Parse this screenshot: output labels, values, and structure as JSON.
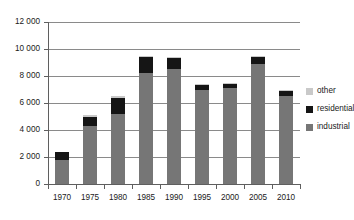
{
  "chart_data": {
    "type": "bar",
    "subtype": "stacked-bar",
    "title": "",
    "subtitle": "",
    "xlabel": "",
    "ylabel": "",
    "categories": [
      "1970",
      "1975",
      "1980",
      "1985",
      "1990",
      "1995",
      "2000",
      "2005",
      "2010"
    ],
    "series": [
      {
        "name": "industrial",
        "color": "#767676",
        "values": [
          1800,
          4300,
          5200,
          8200,
          8500,
          7000,
          7100,
          8900,
          6500
        ]
      },
      {
        "name": "residential",
        "color": "#151515",
        "values": [
          600,
          700,
          1200,
          1200,
          800,
          350,
          300,
          500,
          400
        ]
      },
      {
        "name": "other",
        "color": "#c9c9c9",
        "values": [
          0,
          100,
          100,
          100,
          100,
          50,
          50,
          100,
          50
        ]
      }
    ],
    "totals": [
      2400,
      5100,
      6500,
      9500,
      9400,
      7400,
      7450,
      9500,
      6950
    ],
    "ylim": [
      0,
      12000
    ],
    "ytick_values": [
      0,
      2000,
      4000,
      6000,
      8000,
      10000,
      12000
    ],
    "ytick_labels": [
      "0",
      "2 000",
      "4 000",
      "6 000",
      "8 000",
      "10 000",
      "12 000"
    ],
    "grid": true,
    "grid_axis": "y",
    "legend": [
      "other",
      "residential",
      "industrial"
    ],
    "legend_position": "right",
    "colors": {
      "industrial": "#767676",
      "residential": "#151515",
      "other": "#c9c9c9",
      "axis": "#5f5f5f",
      "grid": "#8a8a8a",
      "text": "#1a1a1a",
      "background": "#ffffff"
    }
  },
  "axis": {
    "y_labels": [
      "12 000",
      "10 000",
      "8 000",
      "6 000",
      "4 000",
      "2 000",
      "0"
    ],
    "x_labels": [
      "1970",
      "1975",
      "1980",
      "1985",
      "1990",
      "1995",
      "2000",
      "2005",
      "2010"
    ]
  },
  "legend": {
    "items": [
      {
        "label": "other",
        "color": "#c9c9c9"
      },
      {
        "label": "residential",
        "color": "#151515"
      },
      {
        "label": "industrial",
        "color": "#767676"
      }
    ]
  }
}
